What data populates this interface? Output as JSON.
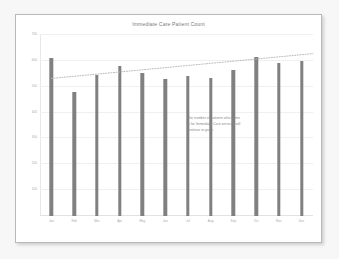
{
  "slide": {
    "annotation": {
      "lines": [
        "The number of patients who come",
        "in for Immediate Care services will",
        "continue to grow."
      ]
    }
  },
  "chart_data": {
    "type": "bar",
    "title": "Immediate Care Patient Count",
    "xlabel": "",
    "ylabel": "",
    "categories": [
      "Jan",
      "Feb",
      "Mar",
      "Apr",
      "May",
      "Jun",
      "Jul",
      "Aug",
      "Sep",
      "Oct",
      "Nov",
      "Dec"
    ],
    "values": [
      610,
      480,
      545,
      580,
      555,
      530,
      540,
      535,
      565,
      615,
      590,
      600
    ],
    "series": [
      {
        "name": "Patient Count",
        "values": [
          610,
          480,
          545,
          580,
          555,
          530,
          540,
          535,
          565,
          615,
          590,
          600
        ]
      }
    ],
    "ylim": [
      0,
      700
    ],
    "yticks": [
      100,
      200,
      300,
      400,
      500,
      600,
      700
    ],
    "ytick_labels": [
      "100",
      "200",
      "300",
      "400",
      "500",
      "600",
      "700"
    ],
    "grid": true,
    "legend": "none",
    "bar_color": "#808080",
    "trendline": {
      "style": "dotted",
      "color": "#b5b5b5",
      "start_value": 532,
      "end_value": 628,
      "extends_past_data": true
    },
    "annotations": [
      "The number of patients who come in for Immediate Care services will continue to grow."
    ]
  }
}
